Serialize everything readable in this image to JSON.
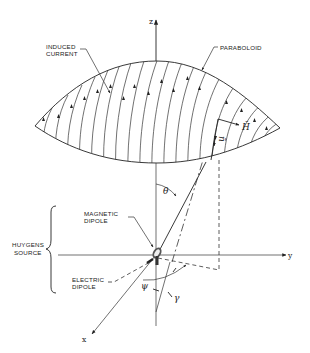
{
  "figure": {
    "type": "3d-coordinate-diagram"
  },
  "axes": {
    "z": {
      "label": "z"
    },
    "y": {
      "label": "y"
    },
    "x": {
      "label": "x"
    }
  },
  "labels": {
    "induced_current_line1": "INDUCED",
    "induced_current_line2": "CURRENT",
    "paraboloid": "PARABOLOID",
    "magnetic_dipole_line1": "MAGNETIC",
    "magnetic_dipole_line2": "DIPOLE",
    "electric_dipole_line1": "ELECTRIC",
    "electric_dipole_line2": "DIPOLE",
    "huygens_source_line1": "HUYGENS",
    "huygens_source_line2": "SOURCE"
  },
  "symbols": {
    "theta": "θ",
    "psi": "ψ",
    "gamma": "γ",
    "normal_vector": "n̄",
    "h_vector": "H̄"
  },
  "colors": {
    "ink": "#222222",
    "background": "#ffffff"
  }
}
